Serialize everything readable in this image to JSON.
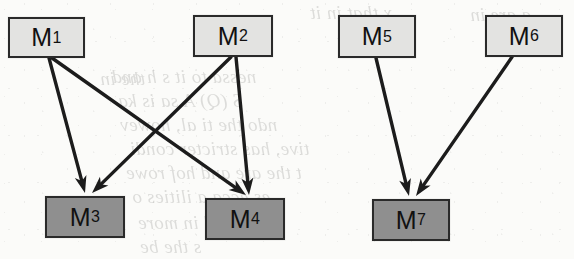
{
  "figure": {
    "kind": "directed-graph",
    "title": "",
    "background_color": "#fbfbf9",
    "node_border_color": "#2a2a2a",
    "edge_color": "#1c1c1c",
    "light_fill": "#e3e3e1",
    "dark_fill": "#8f8f8f"
  },
  "nodes": [
    {
      "id": "M1",
      "base": "M",
      "sub": "1",
      "fill": "light",
      "x": 8,
      "y": 17,
      "w": 77,
      "h": 41
    },
    {
      "id": "M2",
      "base": "M",
      "sub": "2",
      "fill": "light",
      "x": 193,
      "y": 15,
      "w": 80,
      "h": 42
    },
    {
      "id": "M5",
      "base": "M",
      "sub": "5",
      "fill": "light",
      "x": 338,
      "y": 15,
      "w": 78,
      "h": 43
    },
    {
      "id": "M6",
      "base": "M",
      "sub": "6",
      "fill": "light",
      "x": 485,
      "y": 15,
      "w": 78,
      "h": 42
    },
    {
      "id": "M3",
      "base": "M",
      "sub": "3",
      "fill": "dark",
      "x": 45,
      "y": 196,
      "w": 80,
      "h": 42
    },
    {
      "id": "M4",
      "base": "M",
      "sub": "4",
      "fill": "dark",
      "x": 205,
      "y": 198,
      "w": 80,
      "h": 42
    },
    {
      "id": "M7",
      "base": "M",
      "sub": "7",
      "fill": "dark",
      "x": 372,
      "y": 199,
      "w": 78,
      "h": 42
    }
  ],
  "edges": [
    {
      "from": "M1",
      "to": "M3",
      "x1": 49,
      "y1": 58,
      "x2": 85,
      "y2": 193
    },
    {
      "from": "M1",
      "to": "M4",
      "x1": 52,
      "y1": 58,
      "x2": 246,
      "y2": 195
    },
    {
      "from": "M2",
      "to": "M3",
      "x1": 231,
      "y1": 57,
      "x2": 92,
      "y2": 193
    },
    {
      "from": "M2",
      "to": "M4",
      "x1": 236,
      "y1": 57,
      "x2": 249,
      "y2": 195
    },
    {
      "from": "M5",
      "to": "M7",
      "x1": 376,
      "y1": 58,
      "x2": 409,
      "y2": 196
    },
    {
      "from": "M6",
      "to": "M7",
      "x1": 512,
      "y1": 57,
      "x2": 416,
      "y2": 196
    }
  ],
  "bleed_text": [
    {
      "text": "x that in it",
      "x": 310,
      "y": 2
    },
    {
      "text": "a are in",
      "x": 470,
      "y": 4
    },
    {
      "text": "the in",
      "x": 100,
      "y": 68
    },
    {
      "text": "nessa to it s h and",
      "x": 112,
      "y": 66
    },
    {
      "text": "S (Q) A   sa is ka",
      "x": 118,
      "y": 90
    },
    {
      "text": "ndo the ti al, howev",
      "x": 120,
      "y": 114
    },
    {
      "text": "tive, has stricter condi",
      "x": 130,
      "y": 138
    },
    {
      "text": "t the are and hof rowe",
      "x": 126,
      "y": 162
    },
    {
      "text": "es ecca a ilities o",
      "x": 132,
      "y": 186
    },
    {
      "text": "alidated in more",
      "x": 138,
      "y": 212
    },
    {
      "text": "s the be",
      "x": 140,
      "y": 236
    }
  ]
}
